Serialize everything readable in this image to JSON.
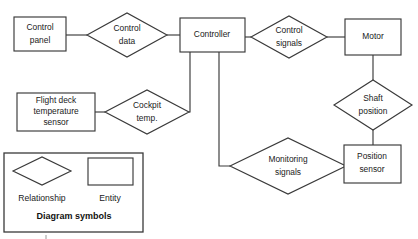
{
  "diagram": {
    "type": "entity-relationship-diagram",
    "title": "Diagram symbols",
    "background_color": "#ffffff",
    "stroke_color": "#3a3a3a",
    "text_color": "#1a1a1a",
    "entities": [
      {
        "id": "control-panel",
        "label_line_1": "Control",
        "label_line_2": "panel",
        "x": 14,
        "y": 17,
        "width": 52,
        "height": 34
      },
      {
        "id": "controller",
        "label_line_1": "Controller",
        "label_line_2": "",
        "x": 180,
        "y": 18,
        "width": 65,
        "height": 34
      },
      {
        "id": "motor",
        "label_line_1": "Motor",
        "label_line_2": "",
        "x": 345,
        "y": 19,
        "width": 56,
        "height": 36
      },
      {
        "id": "flight-deck-temperature-sensor",
        "label_line_1": "Flight deck",
        "label_line_2": "temperature",
        "label_line_3": "sensor",
        "x": 17,
        "y": 93,
        "width": 78,
        "height": 38
      },
      {
        "id": "position-sensor",
        "label_line_1": "Position",
        "label_line_2": "sensor",
        "x": 344,
        "y": 145,
        "width": 57,
        "height": 38
      }
    ],
    "relationships": [
      {
        "id": "control-data",
        "label_line_1": "Control",
        "label_line_2": "data",
        "cx": 127,
        "cy": 35,
        "rx": 40,
        "ry": 22
      },
      {
        "id": "control-signals",
        "label_line_1": "Control",
        "label_line_2": "signals",
        "cx": 289,
        "cy": 37,
        "rx": 38,
        "ry": 21
      },
      {
        "id": "cockpit-temp",
        "label_line_1": "Cockpit",
        "label_line_2": "temp.",
        "cx": 147,
        "cy": 112,
        "rx": 42,
        "ry": 22
      },
      {
        "id": "shaft-position",
        "label_line_1": "Shaft",
        "label_line_2": "position",
        "cx": 373,
        "cy": 105,
        "rx": 39,
        "ry": 25
      },
      {
        "id": "monitoring-signals",
        "label_line_1": "Monitoring",
        "label_line_2": "signals",
        "cx": 288,
        "cy": 166,
        "rx": 58,
        "ry": 28
      }
    ],
    "connectors": [
      {
        "id": "control-panel-to-control-data",
        "path": "M66,35 L87,35"
      },
      {
        "id": "control-data-to-controller",
        "path": "M167,35 L180,35"
      },
      {
        "id": "controller-to-control-signals",
        "path": "M245,37 L251,37"
      },
      {
        "id": "control-signals-to-motor",
        "path": "M327,37 L345,37"
      },
      {
        "id": "motor-to-shaft-position",
        "path": "M373,55 L373,80"
      },
      {
        "id": "shaft-position-to-position-sensor",
        "path": "M373,130 L373,145"
      },
      {
        "id": "flight-deck-sensor-to-cockpit-temp",
        "path": "M95,112 L105,112"
      },
      {
        "id": "controller-to-cockpit-temp",
        "path": "M190,52 L190,112 L189,112"
      },
      {
        "id": "controller-to-monitoring-signals",
        "path": "M219,52 L219,166 L230,166"
      },
      {
        "id": "monitoring-signals-to-position-sensor",
        "path": "M345,166 L344,166"
      }
    ],
    "legend": {
      "id": "diagram-symbols-legend",
      "title": "Diagram symbols",
      "x": 4,
      "y": 153,
      "width": 139,
      "height": 79,
      "relationship_label": "Relationship",
      "entity_label": "Entity",
      "relationship_symbol": {
        "cx": 42,
        "cy": 171,
        "rx": 29,
        "ry": 14
      },
      "entity_symbol": {
        "x": 88,
        "y": 158,
        "width": 45,
        "height": 27
      }
    }
  }
}
